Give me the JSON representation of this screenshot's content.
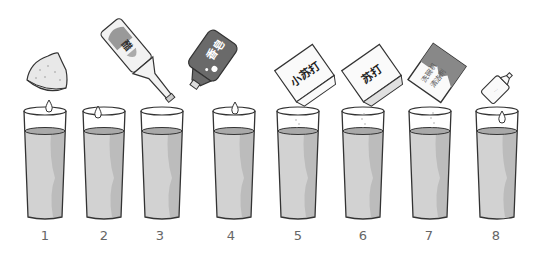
{
  "figure": {
    "items": [
      {
        "number": "1",
        "additive": "lemon half",
        "icon": "lemon-icon",
        "label": "",
        "x": 48
      },
      {
        "number": "2",
        "additive": "vinegar bottle",
        "icon": "vinegar-bottle-icon",
        "label": "醋",
        "x": 104
      },
      {
        "number": "3",
        "additive": "none",
        "icon": "",
        "label": "",
        "x": 162
      },
      {
        "number": "4",
        "additive": "dark liquid bottle",
        "icon": "dark-bottle-icon",
        "label": "香皂",
        "x": 234
      },
      {
        "number": "5",
        "additive": "baking soda box",
        "icon": "baking-soda-box-icon",
        "label": "小苏打",
        "x": 298
      },
      {
        "number": "6",
        "additive": "soda box",
        "icon": "soda-box-icon",
        "label": "苏打",
        "x": 363
      },
      {
        "number": "7",
        "additive": "dishwasher detergent box",
        "icon": "detergent-box-icon",
        "label": "洗碗机清洁剂",
        "x": 430
      },
      {
        "number": "8",
        "additive": "small bottle",
        "icon": "small-bottle-icon",
        "label": "",
        "x": 497
      }
    ]
  },
  "colors": {
    "liquid": "#d2d2d2",
    "liquid_shadow": "#b9b9b9",
    "liquid_surface": "#a9a9a9",
    "outline": "#333333",
    "dark_bottle": "#6a6a6a",
    "label_text": "#666666"
  }
}
